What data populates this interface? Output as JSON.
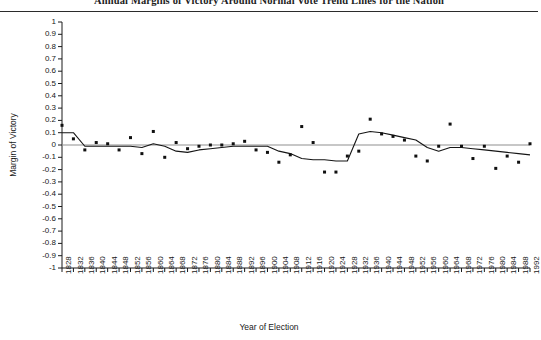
{
  "chart_title": "Annual Margins of Victory Around Normal Vote Trend Lines for the Nation",
  "axes": {
    "ylabel": "Margin of Victory",
    "xlabel": "Year of Election"
  },
  "chart_data": {
    "type": "scatter",
    "title": "Annual Margins of Victory Around Normal Vote Trend Lines for the Nation",
    "xlabel": "Year of Election",
    "ylabel": "Margin of Victory",
    "xlim": [
      1828,
      1992
    ],
    "ylim": [
      -1,
      1
    ],
    "grid": false,
    "legend": "none",
    "ytick_labels": [
      "1",
      "0.9",
      "0.8",
      "0.7",
      "0.6",
      "0.5",
      "0.4",
      "0.3",
      "0.2",
      "0.1",
      "0",
      "-0.1",
      "-0.2",
      "-0.3",
      "-0.4",
      "-0.5",
      "-0.6",
      "-0.7",
      "-0.8",
      "-0.9",
      "-1"
    ],
    "ytick_values": [
      1,
      0.9,
      0.8,
      0.7,
      0.6,
      0.5,
      0.4,
      0.3,
      0.2,
      0.1,
      0,
      -0.1,
      -0.2,
      -0.3,
      -0.4,
      -0.5,
      -0.6,
      -0.7,
      -0.8,
      -0.9,
      -1
    ],
    "xtick_labels": [
      "1828",
      "1832",
      "1836",
      "1840",
      "1844",
      "1848",
      "1852",
      "1856",
      "1860",
      "1864",
      "1868",
      "1872",
      "1876",
      "1880",
      "1884",
      "1888",
      "1892",
      "1896",
      "1900",
      "1904",
      "1908",
      "1912",
      "1916",
      "1920",
      "1924",
      "1928",
      "1932",
      "1936",
      "1940",
      "1944",
      "1948",
      "1952",
      "1956",
      "1960",
      "1964",
      "1968",
      "1972",
      "1976",
      "1980",
      "1984",
      "1988",
      "1992"
    ],
    "series": [
      {
        "name": "Margin of Victory (observed)",
        "type": "scatter",
        "marker": "filled-square",
        "x": [
          1828,
          1832,
          1836,
          1840,
          1844,
          1848,
          1852,
          1856,
          1860,
          1864,
          1868,
          1872,
          1876,
          1880,
          1884,
          1888,
          1892,
          1896,
          1900,
          1904,
          1908,
          1912,
          1916,
          1920,
          1924,
          1928,
          1932,
          1936,
          1940,
          1944,
          1948,
          1952,
          1956,
          1960,
          1964,
          1968,
          1972,
          1976,
          1980,
          1984,
          1988,
          1992
        ],
        "values": [
          0.16,
          0.05,
          -0.04,
          0.02,
          0.01,
          -0.04,
          0.06,
          -0.07,
          0.11,
          -0.1,
          0.02,
          -0.03,
          -0.01,
          0.0,
          0.0,
          0.01,
          0.03,
          -0.04,
          -0.06,
          -0.14,
          -0.08,
          0.15,
          0.02,
          -0.22,
          -0.22,
          -0.09,
          -0.05,
          0.21,
          0.09,
          0.07,
          0.04,
          -0.09,
          -0.13,
          -0.01,
          0.17,
          -0.01,
          -0.11,
          -0.01,
          -0.19,
          -0.09,
          -0.14,
          0.01
        ]
      },
      {
        "name": "Normal Vote Trend Line",
        "type": "line",
        "x": [
          1828,
          1832,
          1836,
          1840,
          1844,
          1848,
          1852,
          1856,
          1860,
          1864,
          1868,
          1872,
          1876,
          1880,
          1884,
          1888,
          1892,
          1896,
          1900,
          1904,
          1908,
          1912,
          1916,
          1920,
          1924,
          1928,
          1932,
          1936,
          1940,
          1944,
          1948,
          1952,
          1956,
          1960,
          1964,
          1968,
          1972,
          1976,
          1980,
          1984,
          1988,
          1992
        ],
        "values": [
          0.1,
          0.1,
          -0.01,
          -0.01,
          -0.01,
          -0.01,
          -0.01,
          -0.02,
          0.01,
          -0.01,
          -0.05,
          -0.06,
          -0.04,
          -0.03,
          -0.02,
          -0.01,
          -0.01,
          -0.01,
          -0.01,
          -0.05,
          -0.07,
          -0.11,
          -0.12,
          -0.12,
          -0.13,
          -0.13,
          0.09,
          0.11,
          0.1,
          0.08,
          0.06,
          0.04,
          -0.02,
          -0.05,
          -0.02,
          -0.02,
          -0.03,
          -0.04,
          -0.05,
          -0.06,
          -0.07,
          -0.08
        ]
      },
      {
        "name": "Zero Reference Line",
        "type": "line",
        "x": [
          1828,
          1992
        ],
        "values": [
          0,
          0
        ]
      }
    ]
  }
}
